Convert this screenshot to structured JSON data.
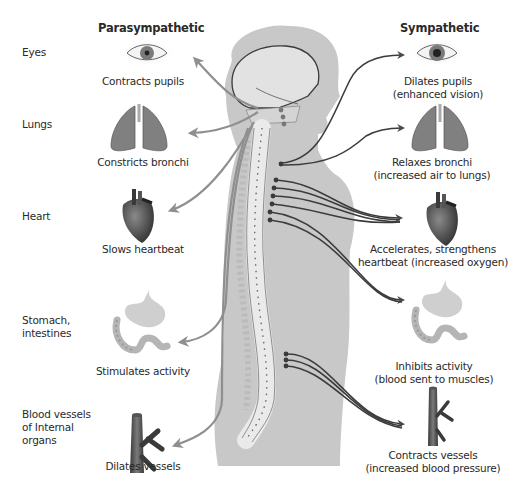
{
  "headers": {
    "left": "Parasympathetic",
    "right": "Sympathetic"
  },
  "organs": [
    {
      "id": "eyes",
      "label_lines": [
        "Eyes"
      ],
      "icon": "eye-icon",
      "parasympathetic": [
        "Contracts pupils"
      ],
      "sympathetic": [
        "Dilates pupils",
        "(enhanced vision)"
      ]
    },
    {
      "id": "lungs",
      "label_lines": [
        "Lungs"
      ],
      "icon": "lungs-icon",
      "parasympathetic": [
        "Constricts bronchi"
      ],
      "sympathetic": [
        "Relaxes bronchi",
        "(increased air to lungs)"
      ]
    },
    {
      "id": "heart",
      "label_lines": [
        "Heart"
      ],
      "icon": "heart-icon",
      "parasympathetic": [
        "Slows heartbeat"
      ],
      "sympathetic": [
        "Accelerates, strengthens",
        "heartbeat (increased oxygen)"
      ]
    },
    {
      "id": "stomach",
      "label_lines": [
        "Stomach,",
        "intestines"
      ],
      "icon": "stomach-intestines-icon",
      "parasympathetic": [
        "Stimulates activity"
      ],
      "sympathetic": [
        "Inhibits activity",
        "(blood sent to muscles)"
      ]
    },
    {
      "id": "vessels",
      "label_lines": [
        "Blood vessels",
        "of Internal",
        "organs"
      ],
      "icon": "blood-vessel-icon",
      "parasympathetic": [
        "Dilates vessels"
      ],
      "sympathetic": [
        "Contracts vessels",
        "(increased blood pressure)"
      ]
    }
  ],
  "colors": {
    "body": "#c8c8c8",
    "spine": "#e9e9e9",
    "parasympathetic_arrow": "#8f8f8f",
    "sympathetic_arrow": "#3c3c3c",
    "organ_fill": "#7c7c7c",
    "text": "#2a2a2a"
  }
}
